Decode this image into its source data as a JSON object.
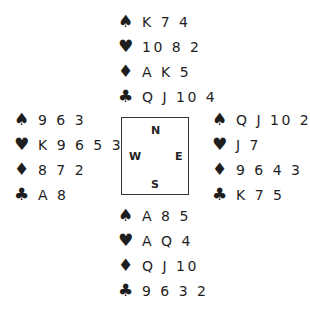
{
  "suits": {
    "spades": "♠",
    "hearts": "♥",
    "diamonds": "♦",
    "clubs": "♣"
  },
  "compass": {
    "north": "N",
    "south": "S",
    "east": "E",
    "west": "W"
  },
  "hands": {
    "north": {
      "spades": "K 7 4",
      "hearts": "10 8 2",
      "diamonds": "A K 5",
      "clubs": "Q J 10 4"
    },
    "west": {
      "spades": "9 6 3",
      "hearts": "K 9 6 5 3",
      "diamonds": "8 7 2",
      "clubs": "A 8"
    },
    "east": {
      "spades": "Q J 10 2",
      "hearts": "J 7",
      "diamonds": "9 6 4 3",
      "clubs": "K 7 5"
    },
    "south": {
      "spades": "A 8 5",
      "hearts": "A Q 4",
      "diamonds": "Q J 10",
      "clubs": "9 6 3 2"
    }
  }
}
